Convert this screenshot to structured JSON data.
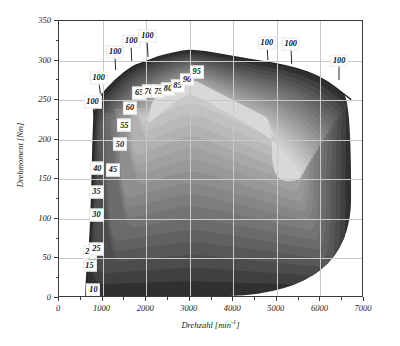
{
  "chart_data": {
    "type": "contour",
    "title": "",
    "xlabel": "Drehzahl [min-1]",
    "xlabel_base": "Drehzahl [min",
    "xlabel_sup": "-1",
    "xlabel_tail": "]",
    "ylabel": "Drehmoment [Nm]",
    "xlim": [
      0,
      7000
    ],
    "ylim": [
      0,
      350
    ],
    "xticks": [
      0,
      1000,
      2000,
      3000,
      4000,
      5000,
      6000,
      7000
    ],
    "yticks": [
      0,
      50,
      100,
      150,
      200,
      250,
      300,
      350
    ],
    "xtick_labels": [
      "0",
      "1000",
      "2000",
      "3000",
      "4000",
      "5000",
      "6000",
      "7000"
    ],
    "ytick_labels": [
      "0",
      "50",
      "100",
      "150",
      "200",
      "250",
      "300",
      "350"
    ],
    "grid": true,
    "legend": "none",
    "colormap": "grayscale",
    "full_load_curve": [
      {
        "x": 620,
        "y": 0
      },
      {
        "x": 640,
        "y": 30
      },
      {
        "x": 700,
        "y": 55
      },
      {
        "x": 760,
        "y": 130
      },
      {
        "x": 790,
        "y": 210
      },
      {
        "x": 830,
        "y": 243
      },
      {
        "x": 1000,
        "y": 258
      },
      {
        "x": 1300,
        "y": 275
      },
      {
        "x": 1700,
        "y": 293
      },
      {
        "x": 2000,
        "y": 298
      },
      {
        "x": 2300,
        "y": 305
      },
      {
        "x": 2700,
        "y": 310
      },
      {
        "x": 3000,
        "y": 313
      },
      {
        "x": 3400,
        "y": 311
      },
      {
        "x": 3900,
        "y": 306
      },
      {
        "x": 4400,
        "y": 301
      },
      {
        "x": 5000,
        "y": 296
      },
      {
        "x": 5500,
        "y": 290
      },
      {
        "x": 6000,
        "y": 280
      },
      {
        "x": 6400,
        "y": 265
      },
      {
        "x": 6750,
        "y": 250
      }
    ],
    "contour_levels": [
      10,
      15,
      20,
      25,
      30,
      35,
      40,
      45,
      50,
      55,
      60,
      65,
      70,
      75,
      80,
      85,
      90,
      95,
      100
    ],
    "contour_labels": [
      {
        "value": "10",
        "x": 790,
        "y": 10,
        "leader": null
      },
      {
        "value": "15",
        "x": 700,
        "y": 41,
        "leader": null
      },
      {
        "value": "20",
        "x": 700,
        "y": 58,
        "leader": null
      },
      {
        "value": "25",
        "x": 860,
        "y": 62,
        "leader": null
      },
      {
        "value": "30",
        "x": 860,
        "y": 105,
        "leader": null
      },
      {
        "value": "35",
        "x": 860,
        "y": 134,
        "leader": null
      },
      {
        "value": "40",
        "x": 880,
        "y": 164,
        "leader": null
      },
      {
        "value": "45",
        "x": 1240,
        "y": 162,
        "leader": null
      },
      {
        "value": "50",
        "x": 1400,
        "y": 194,
        "leader": null
      },
      {
        "value": "55",
        "x": 1500,
        "y": 218,
        "leader": null
      },
      {
        "value": "60",
        "x": 1630,
        "y": 240,
        "leader": null
      },
      {
        "value": "65",
        "x": 1840,
        "y": 259,
        "leader": null
      },
      {
        "value": "70",
        "x": 2060,
        "y": 261,
        "leader": null
      },
      {
        "value": "75",
        "x": 2280,
        "y": 261,
        "leader": null
      },
      {
        "value": "80",
        "x": 2500,
        "y": 264,
        "leader": null
      },
      {
        "value": "85",
        "x": 2720,
        "y": 268,
        "leader": null
      },
      {
        "value": "90",
        "x": 2940,
        "y": 276,
        "leader": null
      },
      {
        "value": "95",
        "x": 3160,
        "y": 286,
        "leader": null
      }
    ],
    "peak_labels": [
      {
        "value": "100",
        "x": 770,
        "y": 248,
        "leader_to_x": 820,
        "leader_to_y": 215
      },
      {
        "value": "100",
        "x": 910,
        "y": 278,
        "leader_to_x": 950,
        "leader_to_y": 258
      },
      {
        "value": "100",
        "x": 1290,
        "y": 311,
        "leader_to_x": 1310,
        "leader_to_y": 288
      },
      {
        "value": "100",
        "x": 1660,
        "y": 325,
        "leader_to_x": 1680,
        "leader_to_y": 300
      },
      {
        "value": "100",
        "x": 2030,
        "y": 331,
        "leader_to_x": 2060,
        "leader_to_y": 305
      },
      {
        "value": "100",
        "x": 4770,
        "y": 322,
        "leader_to_x": 4800,
        "leader_to_y": 300
      },
      {
        "value": "100",
        "x": 5320,
        "y": 321,
        "leader_to_x": 5340,
        "leader_to_y": 296
      },
      {
        "value": "100",
        "x": 6430,
        "y": 300,
        "leader_to_x": 6430,
        "leader_to_y": 276
      }
    ]
  },
  "figure": {
    "caption_fragment": ""
  }
}
